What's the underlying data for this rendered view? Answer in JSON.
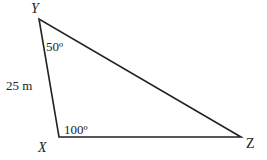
{
  "diagram": {
    "type": "triangle",
    "stroke_color": "#222222",
    "vertices": {
      "Y": {
        "label": "Y",
        "x": 39,
        "y": 19
      },
      "X": {
        "label": "X",
        "x": 59,
        "y": 137
      },
      "Z": {
        "label": "Z",
        "x": 241,
        "y": 137
      }
    },
    "sides": [
      {
        "from": "Y",
        "to": "X",
        "label": "25 m"
      }
    ],
    "angles": [
      {
        "at": "Y",
        "label": "50º"
      },
      {
        "at": "X",
        "label": "100º"
      }
    ]
  }
}
